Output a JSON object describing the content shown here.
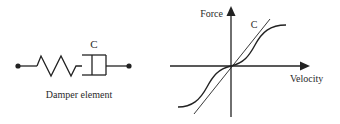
{
  "left_diagram": {
    "element_label": "C",
    "caption": "Damper element"
  },
  "right_diagram": {
    "y_axis_label": "Force",
    "x_axis_label": "Velocity",
    "line_label": "C"
  },
  "colors": {
    "ink": "#222222",
    "background": "#ffffff"
  }
}
